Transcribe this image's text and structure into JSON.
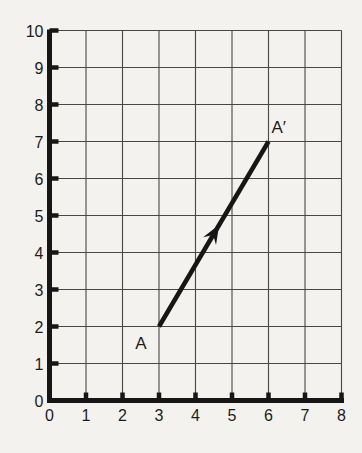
{
  "figure": {
    "background_color": "#f4f2ee",
    "grid_color": "#474747",
    "axis_color": "#161616",
    "vector_color": "#161616",
    "text_color": "#1c1c1c"
  },
  "chart_data": {
    "type": "line",
    "title": "",
    "xlabel": "",
    "ylabel": "",
    "xlim": [
      0,
      8
    ],
    "ylim": [
      0,
      10
    ],
    "x_ticks": [
      "0",
      "1",
      "2",
      "3",
      "4",
      "5",
      "6",
      "7",
      "8"
    ],
    "y_ticks": [
      "0",
      "1",
      "2",
      "3",
      "4",
      "5",
      "6",
      "7",
      "8",
      "9",
      "10"
    ],
    "grid": "on",
    "legend": "none",
    "series": [
      {
        "name": "translation-segment-A-to-A-prime",
        "points": [
          {
            "label": "A",
            "x": 3,
            "y": 2
          },
          {
            "label": "A′",
            "x": 6,
            "y": 7
          }
        ],
        "arrow_at_fraction": 0.55
      }
    ]
  }
}
